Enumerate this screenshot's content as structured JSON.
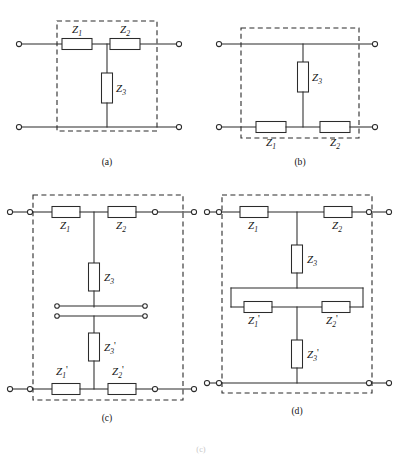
{
  "figure": {
    "background_color": "#ffffff",
    "line_color": "#2b2b2b",
    "caption": "(c)"
  },
  "panels": [
    {
      "id": "a",
      "caption": "(a)",
      "topology": "T-network",
      "description": "Series Z1 and Z2 along top rail with shunt Z3 to bottom rail",
      "label_position": "above",
      "components": [
        {
          "name": "Z1",
          "base": "Z",
          "sub": "1",
          "prime": "",
          "orientation": "horizontal",
          "label_side": "above"
        },
        {
          "name": "Z2",
          "base": "Z",
          "sub": "2",
          "prime": "",
          "orientation": "horizontal",
          "label_side": "above"
        },
        {
          "name": "Z3",
          "base": "Z",
          "sub": "3",
          "prime": "",
          "orientation": "vertical",
          "label_side": "right"
        }
      ],
      "terminal_count": 4,
      "has_dashed_enclosure": true
    },
    {
      "id": "b",
      "caption": "(b)",
      "topology": "inverted-T-network",
      "description": "Plain top rail, series Z1 and Z2 along bottom rail with shunt Z3 rising to top rail",
      "label_position": "below",
      "components": [
        {
          "name": "Z3",
          "base": "Z",
          "sub": "3",
          "prime": "",
          "orientation": "vertical",
          "label_side": "right"
        },
        {
          "name": "Z1",
          "base": "Z",
          "sub": "1",
          "prime": "",
          "orientation": "horizontal",
          "label_side": "below"
        },
        {
          "name": "Z2",
          "base": "Z",
          "sub": "2",
          "prime": "",
          "orientation": "horizontal",
          "label_side": "below"
        }
      ],
      "terminal_count": 4,
      "has_dashed_enclosure": true
    },
    {
      "id": "c",
      "caption": "(c)",
      "topology": "cascaded-T-networks-with-break",
      "description": "Upper T of Z1 Z2 Z3 cascaded through a four-terminal break into a lower T of Z3-prime Z1-prime Z2-prime",
      "label_position": "below",
      "components": [
        {
          "name": "Z1",
          "base": "Z",
          "sub": "1",
          "prime": "",
          "orientation": "horizontal",
          "label_side": "below"
        },
        {
          "name": "Z2",
          "base": "Z",
          "sub": "2",
          "prime": "",
          "orientation": "horizontal",
          "label_side": "below"
        },
        {
          "name": "Z3",
          "base": "Z",
          "sub": "3",
          "prime": "",
          "orientation": "vertical",
          "label_side": "right"
        },
        {
          "name": "Z3'",
          "base": "Z",
          "sub": "3",
          "prime": "'",
          "orientation": "vertical",
          "label_side": "right"
        },
        {
          "name": "Z1'",
          "base": "Z",
          "sub": "1",
          "prime": "'",
          "orientation": "horizontal",
          "label_side": "above"
        },
        {
          "name": "Z2'",
          "base": "Z",
          "sub": "2",
          "prime": "'",
          "orientation": "horizontal",
          "label_side": "above"
        }
      ],
      "terminal_count": 12,
      "has_dashed_enclosure": true,
      "has_interconnect_break": true
    },
    {
      "id": "d",
      "caption": "(d)",
      "topology": "cascaded-T-networks-merged",
      "description": "Upper T of Z1 Z2 Z3 merging into a rectangular loop containing Z1-prime and Z2-prime, with shunt Z3-prime to the bottom rail",
      "label_position": "below",
      "components": [
        {
          "name": "Z1",
          "base": "Z",
          "sub": "1",
          "prime": "",
          "orientation": "horizontal",
          "label_side": "below"
        },
        {
          "name": "Z2",
          "base": "Z",
          "sub": "2",
          "prime": "",
          "orientation": "horizontal",
          "label_side": "below"
        },
        {
          "name": "Z3",
          "base": "Z",
          "sub": "3",
          "prime": "",
          "orientation": "vertical",
          "label_side": "right"
        },
        {
          "name": "Z1'",
          "base": "Z",
          "sub": "1",
          "prime": "'",
          "orientation": "horizontal",
          "label_side": "below"
        },
        {
          "name": "Z2'",
          "base": "Z",
          "sub": "2",
          "prime": "'",
          "orientation": "horizontal",
          "label_side": "below"
        },
        {
          "name": "Z3'",
          "base": "Z",
          "sub": "3",
          "prime": "'",
          "orientation": "vertical",
          "label_side": "right"
        }
      ],
      "terminal_count": 8,
      "has_dashed_enclosure": true,
      "has_merge_loop": true
    }
  ],
  "labels": {
    "a_z1": "Z",
    "a_z1_sub": "1",
    "a_z2": "Z",
    "a_z2_sub": "2",
    "a_z3": "Z",
    "a_z3_sub": "3",
    "b_z1": "Z",
    "b_z1_sub": "1",
    "b_z2": "Z",
    "b_z2_sub": "2",
    "b_z3": "Z",
    "b_z3_sub": "3",
    "c_z1": "Z",
    "c_z1_sub": "1",
    "c_z2": "Z",
    "c_z2_sub": "2",
    "c_z3": "Z",
    "c_z3_sub": "3",
    "c_z3p": "Z",
    "c_z3p_sub": "3",
    "c_z3p_prime": "'",
    "c_z1p": "Z",
    "c_z1p_sub": "1",
    "c_z1p_prime": "'",
    "c_z2p": "Z",
    "c_z2p_sub": "2",
    "c_z2p_prime": "'",
    "d_z1": "Z",
    "d_z1_sub": "1",
    "d_z2": "Z",
    "d_z2_sub": "2",
    "d_z3": "Z",
    "d_z3_sub": "3",
    "d_z1p": "Z",
    "d_z1p_sub": "1",
    "d_z1p_prime": "'",
    "d_z2p": "Z",
    "d_z2p_sub": "2",
    "d_z2p_prime": "'",
    "d_z3p": "Z",
    "d_z3p_sub": "3",
    "d_z3p_prime": "'"
  },
  "captions": {
    "a": "(a)",
    "b": "(b)",
    "c": "(c)",
    "d": "(d)",
    "bottom": "(c)"
  }
}
